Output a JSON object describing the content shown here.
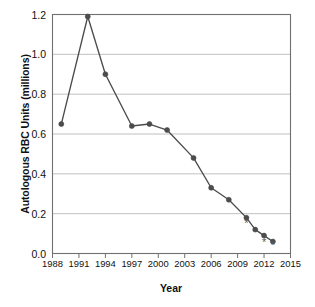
{
  "chart_data": {
    "type": "line",
    "title": "",
    "xlabel": "Year",
    "ylabel": "Autologous RBC Units (millions)",
    "xlim": [
      1988,
      2015
    ],
    "ylim": [
      0.0,
      1.2
    ],
    "xticks": [
      "1988",
      "1991",
      "1994",
      "1997",
      "2000",
      "2003",
      "2006",
      "2009",
      "2012",
      "2015"
    ],
    "xtick_values": [
      1988,
      1991,
      1994,
      1997,
      2000,
      2003,
      2006,
      2009,
      2012,
      2015
    ],
    "yticks": [
      "0.0",
      "0.2",
      "0.4",
      "0.6",
      "0.8",
      "1.0",
      "1.2"
    ],
    "ytick_values": [
      0.0,
      0.2,
      0.4,
      0.6,
      0.8,
      1.0,
      1.2
    ],
    "grid": "horizontal",
    "legend": "none",
    "series": [
      {
        "name": "Autologous RBC Units",
        "color": "#4c4c4c",
        "marker": "circle",
        "x": [
          1989,
          1992,
          1994,
          1997,
          1999,
          2001,
          2004,
          2006,
          2008,
          2010,
          2011,
          2012,
          2013
        ],
        "values": [
          0.65,
          1.19,
          0.9,
          0.64,
          0.65,
          0.62,
          0.48,
          0.33,
          0.27,
          0.18,
          0.12,
          0.09,
          0.06
        ]
      }
    ],
    "annotations": [
      {
        "symbol": "*",
        "x": 2010,
        "y": 0.135,
        "note": "asterisk below 2010 point"
      },
      {
        "symbol": "*",
        "x": 2012,
        "y": 0.04,
        "note": "asterisk below 2012 point"
      },
      {
        "symbol": "*",
        "x": 2013,
        "y": 0.025,
        "note": "asterisk below 2013 point"
      }
    ]
  }
}
